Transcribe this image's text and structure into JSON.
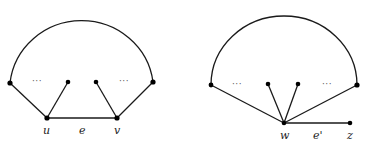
{
  "figure": {
    "left_graph": {
      "labels": {
        "u": "u",
        "v": "v",
        "edge": "e",
        "dots_left": "···",
        "dots_right": "···"
      },
      "nodes": [
        {
          "id": "left-end",
          "x": 10,
          "y": 83
        },
        {
          "id": "inner-left",
          "x": 68,
          "y": 82
        },
        {
          "id": "inner-right",
          "x": 96,
          "y": 82
        },
        {
          "id": "right-end",
          "x": 153,
          "y": 82
        },
        {
          "id": "u",
          "x": 47,
          "y": 118
        },
        {
          "id": "v",
          "x": 117,
          "y": 118
        }
      ],
      "edges": [
        [
          "left-end",
          "u"
        ],
        [
          "inner-left",
          "u"
        ],
        [
          "u",
          "v"
        ],
        [
          "inner-right",
          "v"
        ],
        [
          "right-end",
          "v"
        ]
      ],
      "arc": {
        "from": "left-end",
        "to": "right-end"
      }
    },
    "right_graph": {
      "labels": {
        "w": "w",
        "z": "z",
        "edge": "e'",
        "dots_left": "···",
        "dots_right": "···"
      },
      "nodes": [
        {
          "id": "left-end",
          "x": 211,
          "y": 85
        },
        {
          "id": "inner-left",
          "x": 268,
          "y": 84
        },
        {
          "id": "inner-right",
          "x": 298,
          "y": 84
        },
        {
          "id": "right-end",
          "x": 357,
          "y": 85
        },
        {
          "id": "w",
          "x": 284,
          "y": 123
        },
        {
          "id": "z",
          "x": 350,
          "y": 123
        }
      ],
      "edges": [
        [
          "left-end",
          "w"
        ],
        [
          "inner-left",
          "w"
        ],
        [
          "inner-right",
          "w"
        ],
        [
          "right-end",
          "w"
        ],
        [
          "w",
          "z"
        ]
      ],
      "arc": {
        "from": "left-end",
        "to": "right-end"
      }
    }
  }
}
